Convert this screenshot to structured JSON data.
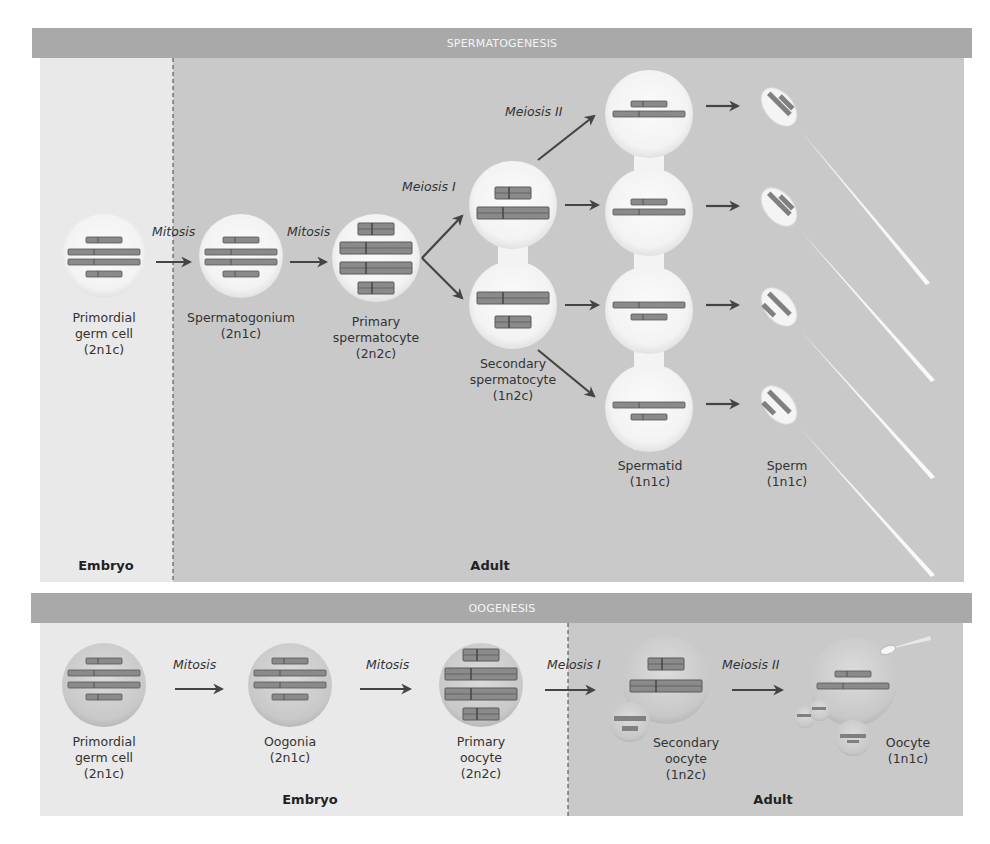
{
  "spermatogenesis": {
    "title": "SPERMATOGENESIS",
    "zones": {
      "embryo": "Embryo",
      "adult": "Adult"
    },
    "steps": {
      "mitosis_1": "Mitosis",
      "mitosis_2": "Mitosis",
      "meiosis_1": "Meiosis I",
      "meiosis_2": "Meiosis II"
    },
    "cells": [
      {
        "name_line1": "Primordial",
        "name_line2": "germ cell",
        "ploidy": "(2n1c)"
      },
      {
        "name_line1": "Spermatogonium",
        "name_line2": "",
        "ploidy": "(2n1c)"
      },
      {
        "name_line1": "Primary",
        "name_line2": "spermatocyte",
        "ploidy": "(2n2c)"
      },
      {
        "name_line1": "Secondary",
        "name_line2": "spermatocyte",
        "ploidy": "(1n2c)"
      },
      {
        "name_line1": "Spermatid",
        "name_line2": "",
        "ploidy": "(1n1c)"
      },
      {
        "name_line1": "Sperm",
        "name_line2": "",
        "ploidy": "(1n1c)"
      }
    ]
  },
  "oogenesis": {
    "title": "OOGENESIS",
    "zones": {
      "embryo": "Embryo",
      "adult": "Adult"
    },
    "steps": {
      "mitosis_1": "Mitosis",
      "mitosis_2": "Mitosis",
      "meiosis_1": "Meiosis I",
      "meiosis_2": "Meiosis II"
    },
    "cells": [
      {
        "name_line1": "Primordial",
        "name_line2": "germ cell",
        "ploidy": "(2n1c)"
      },
      {
        "name_line1": "Oogonia",
        "name_line2": "",
        "ploidy": "(2n1c)"
      },
      {
        "name_line1": "Primary",
        "name_line2": "oocyte",
        "ploidy": "(2n2c)"
      },
      {
        "name_line1": "Secondary",
        "name_line2": "oocyte",
        "ploidy": "(1n2c)"
      },
      {
        "name_line1": "Oocyte",
        "name_line2": "",
        "ploidy": "(1n1c)"
      }
    ]
  },
  "colors": {
    "header_bar": "#a9a9a9",
    "embryo_bg": "#e9e9e9",
    "adult_bg": "#c9c9c9",
    "cell_fill": "#f6f6f6",
    "oocyte_fill": "#cfcfcf",
    "chromosome": "#8a8a8a",
    "arrow": "#444444"
  }
}
